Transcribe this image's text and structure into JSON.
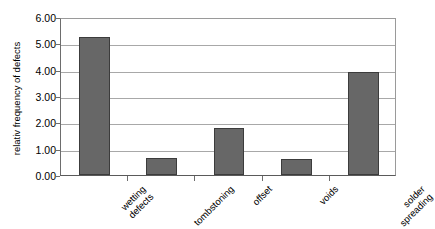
{
  "chart_data": {
    "type": "bar",
    "title": "",
    "subtitle": "",
    "xlabel": "",
    "ylabel": "relativ frequency of defects",
    "categories": [
      "wetting\ndefects",
      "tombstoning",
      "offset",
      "voids",
      "solder\nspreading"
    ],
    "values": [
      5.25,
      0.63,
      1.78,
      0.62,
      3.92
    ],
    "ylim": [
      0.0,
      6.0
    ],
    "ytick_labels": [
      "6.00",
      "5.00",
      "4.00",
      "3.00",
      "2.00",
      "1.00",
      "0.00"
    ],
    "ytick_values": [
      6.0,
      5.0,
      4.0,
      3.0,
      2.0,
      1.0,
      0.0
    ],
    "grid": true,
    "legend": false,
    "legend_position": "none",
    "bar_color": "#676767",
    "bar_edge_color": "#3c3c3c",
    "gridline_color": "#a8a8a8",
    "axis_color": "#6d6d6d",
    "background_color": "#ffffff",
    "xtick_label_rotation": 45
  }
}
